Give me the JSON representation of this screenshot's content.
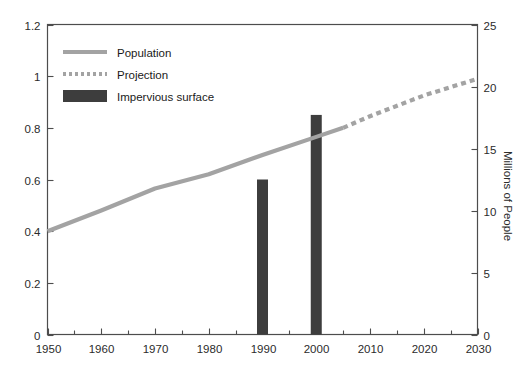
{
  "chart_data": {
    "type": "line",
    "title": "",
    "subtitle": "",
    "xlabel": "",
    "ylabel_left": "",
    "ylabel_right": "Millions of People",
    "grid": false,
    "legend_position": "top-left",
    "xlim": [
      1950,
      2030
    ],
    "ylim_left": [
      0,
      1.2
    ],
    "ylim_right": [
      0,
      25
    ],
    "x_major_ticks": [
      1950,
      1960,
      1970,
      1980,
      1990,
      2000,
      2010,
      2020,
      2030
    ],
    "x_major_tick_labels": [
      "1950",
      "1960",
      "1970",
      "1980",
      "1990",
      "2000",
      "2010",
      "2020",
      "2030"
    ],
    "x_minor_ticks": [
      1955,
      1965,
      1975,
      1985,
      1995,
      2005,
      2015,
      2025
    ],
    "y_left_ticks": [
      0,
      0.2,
      0.4,
      0.6,
      0.8,
      1,
      1.2
    ],
    "y_left_tick_labels": [
      "0",
      "0.2",
      "0.4",
      "0.6",
      "0.8",
      "1",
      "1.2"
    ],
    "y_right_ticks": [
      0,
      5,
      10,
      15,
      20,
      25
    ],
    "y_right_tick_labels": [
      "0",
      "5",
      "10",
      "15",
      "20",
      "25"
    ],
    "series": [
      {
        "name": "Population",
        "style": "solid-line",
        "color": "#a3a3a3",
        "axis": "left",
        "x": [
          1950,
          1960,
          1970,
          1980,
          1990,
          2000,
          2005
        ],
        "values": [
          0.4,
          0.48,
          0.565,
          0.62,
          0.695,
          0.765,
          0.8
        ]
      },
      {
        "name": "Projection",
        "style": "dotted-line",
        "color": "#a3a3a3",
        "axis": "left",
        "x": [
          2005,
          2010,
          2020,
          2030
        ],
        "values": [
          0.8,
          0.845,
          0.925,
          0.99
        ]
      },
      {
        "name": "Impervious surface",
        "style": "bar",
        "color": "#3d3d3d",
        "axis": "left",
        "x": [
          1990,
          2000
        ],
        "values": [
          0.6,
          0.85
        ]
      }
    ]
  },
  "legend": {
    "entries": [
      {
        "label": "Population",
        "swatch": "solid-line",
        "color": "#a3a3a3"
      },
      {
        "label": "Projection",
        "swatch": "dotted-line",
        "color": "#a3a3a3"
      },
      {
        "label": "Impervious surface",
        "swatch": "bar",
        "color": "#3d3d3d"
      }
    ]
  },
  "colors": {
    "line": "#a3a3a3",
    "bar": "#3d3d3d",
    "axis": "#4d4d4d",
    "text": "#2b2b2b",
    "background": "#ffffff"
  }
}
